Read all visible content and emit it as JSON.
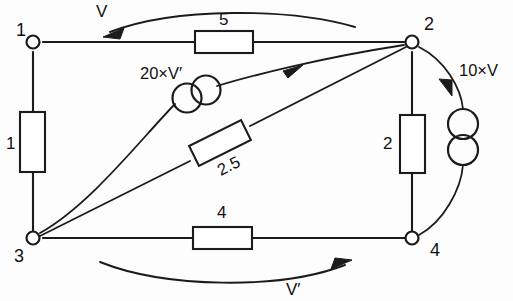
{
  "diagram": {
    "stroke_color": "#1b1b1b",
    "background_color": "#fdfdfd",
    "nodes": [
      {
        "id": "node-1",
        "label": "1",
        "x": 33,
        "y": 42,
        "label_x": 16,
        "label_y": 36
      },
      {
        "id": "node-2",
        "label": "2",
        "x": 412,
        "y": 42,
        "label_x": 424,
        "label_y": 30
      },
      {
        "id": "node-3",
        "label": "3",
        "x": 33,
        "y": 238,
        "label_x": 16,
        "label_y": 262
      },
      {
        "id": "node-4",
        "label": "4",
        "x": 412,
        "y": 238,
        "label_x": 430,
        "label_y": 256
      }
    ],
    "resistors": [
      {
        "id": "resistor-left",
        "label": "1",
        "label_x": 10,
        "label_y": 149,
        "orientation": "vertical"
      },
      {
        "id": "resistor-top",
        "label": "5",
        "label_x": 224,
        "label_y": 25,
        "orientation": "horizontal"
      },
      {
        "id": "resistor-diagonal",
        "label": "2.5",
        "label_x": 237,
        "label_y": 168,
        "orientation": "diagonal"
      },
      {
        "id": "resistor-right",
        "label": "2",
        "label_x": 387,
        "label_y": 149,
        "orientation": "vertical"
      },
      {
        "id": "resistor-bottom",
        "label": "4",
        "label_x": 222,
        "label_y": 218,
        "orientation": "horizontal"
      }
    ],
    "sources": [
      {
        "id": "source-dependent-left",
        "label": "20×V′",
        "label_x": 140,
        "label_y": 79,
        "type": "dependent-voltage-source",
        "style": "two-overlapping-circles"
      },
      {
        "id": "source-dependent-right",
        "label": "10×V",
        "label_x": 459,
        "label_y": 76,
        "type": "dependent-voltage-source",
        "style": "two-stacked-circles"
      }
    ],
    "arrow_labels": [
      {
        "id": "voltage-v",
        "label": "V",
        "label_x": 96,
        "label_y": 16,
        "direction": "leftward"
      },
      {
        "id": "voltage-v-prime",
        "label": "V′",
        "label_x": 286,
        "label_y": 295,
        "direction": "rightward"
      }
    ]
  }
}
